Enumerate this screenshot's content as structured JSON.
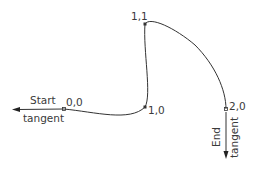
{
  "diagram": {
    "type": "spline-through-points",
    "stroke_color": "#333333",
    "points": [
      {
        "label": "0,0",
        "x": 64,
        "y": 109
      },
      {
        "label": "1,0",
        "x": 145,
        "y": 107
      },
      {
        "label": "1,1",
        "x": 145,
        "y": 24
      },
      {
        "label": "2,0",
        "x": 226,
        "y": 109
      }
    ],
    "start_tangent": {
      "line1": "Start",
      "line2": "tangent"
    },
    "end_tangent": {
      "line1": "End",
      "line2": "tangent"
    }
  }
}
